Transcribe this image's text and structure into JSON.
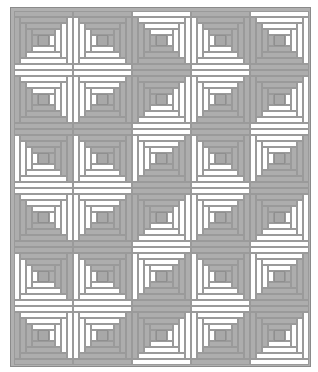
{
  "colors": {
    "dark": "#adadad",
    "light": "#ffffff",
    "border": "#b0b0b0",
    "center": "#a8a8a8"
  },
  "grid": {
    "columns": 5,
    "rows": 6
  },
  "blocks": [
    [
      "BR",
      "BL",
      "TR",
      "BL",
      "TR"
    ],
    [
      "TR",
      "TL",
      "BR",
      "TL",
      "BR"
    ],
    [
      "BL",
      "BL",
      "TL",
      "BL",
      "TL"
    ],
    [
      "TR",
      "TL",
      "BR",
      "TL",
      "BR"
    ],
    [
      "BL",
      "BL",
      "TL",
      "BL",
      "TL"
    ],
    [
      "TR",
      "TL",
      "BR",
      "TL",
      "BR"
    ]
  ]
}
